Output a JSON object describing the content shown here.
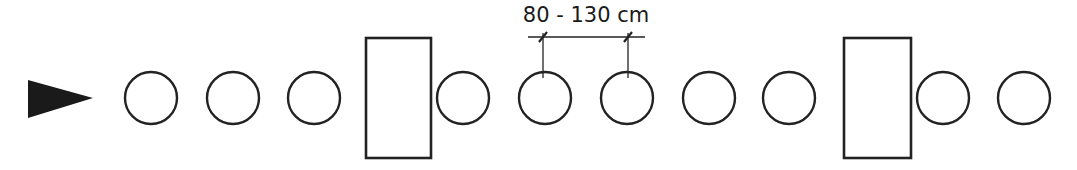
{
  "diagram": {
    "stroke_color": "#222222",
    "background": "#ffffff",
    "direction_arrow": {
      "points": "28,80 93,98 28,118",
      "fill": "#1a1a1a"
    },
    "circle_radius": 26,
    "circle_cy": 98,
    "circles": [
      {
        "cx": 151
      },
      {
        "cx": 233
      },
      {
        "cx": 314
      },
      {
        "cx": 463
      },
      {
        "cx": 545
      },
      {
        "cx": 627
      },
      {
        "cx": 709
      },
      {
        "cx": 789
      },
      {
        "cx": 943
      },
      {
        "cx": 1024
      }
    ],
    "rectangles": [
      {
        "x": 366,
        "y": 38,
        "w": 65,
        "h": 120
      },
      {
        "x": 844,
        "y": 38,
        "w": 67,
        "h": 120
      }
    ],
    "dimension": {
      "label": "80 - 130 cm",
      "line_y": 37,
      "line_x1": 528,
      "line_x2": 645,
      "tick1_x": 543,
      "tick2_x": 628,
      "label_x": 586,
      "label_y": 22
    }
  }
}
